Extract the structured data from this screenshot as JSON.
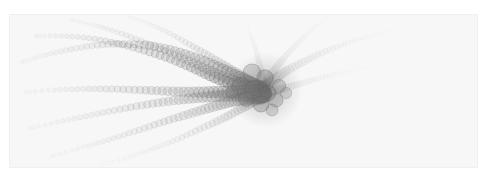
{
  "figure": {
    "title": "",
    "subtitle": "",
    "width": 491,
    "height": 180,
    "page_background": "#ffffff",
    "panel_background": "#f7f7f7",
    "panel_edge_color": "#f0f0f0",
    "panel": {
      "x": 9,
      "y": 14,
      "width": 469,
      "height": 154
    },
    "has_axes": false,
    "has_gridlines": false,
    "has_legend": false,
    "has_text_labels": false,
    "alt_text": "A pale grey radial structure resembling a comet or tentacled organism, formed from chains of overlapping circles converging into a dark cluster right of center, with arms sweeping out to the left and faint ghost arms to the upper right."
  },
  "chart_data": {
    "type": "scatter",
    "title": "",
    "subtitle": "",
    "xlabel": "",
    "ylabel": "",
    "xlim": [
      0,
      491
    ],
    "ylim": [
      0,
      180
    ],
    "grid": false,
    "legend_position": "none",
    "marker": "circle",
    "marker_style": {
      "fill_color": "#808080",
      "stroke_color": "#606060",
      "stroke_width": 0.6,
      "fill_opacity_range": [
        0.02,
        0.5
      ],
      "radius_range": [
        1.4,
        9.5
      ]
    },
    "core": {
      "label": "convergence cluster",
      "x": 265,
      "y": 90,
      "darkest_color": "#505050",
      "approx_radius": 38
    },
    "annotations": [],
    "series": [
      {
        "name": "arm-1-upper-left-far",
        "opacity": 0.3,
        "tip_radius": 2.2,
        "base_radius": 7.0,
        "n_points": 52,
        "path": [
          [
            22,
            62
          ],
          [
            46,
            55
          ],
          [
            72,
            49
          ],
          [
            99,
            45
          ],
          [
            126,
            44
          ],
          [
            152,
            46
          ],
          [
            178,
            52
          ],
          [
            203,
            61
          ],
          [
            226,
            71
          ],
          [
            246,
            81
          ],
          [
            261,
            88
          ]
        ]
      },
      {
        "name": "arm-2-upper-left-mid",
        "opacity": 0.4,
        "tip_radius": 2.0,
        "base_radius": 7.6,
        "n_points": 50,
        "path": [
          [
            36,
            36
          ],
          [
            61,
            36
          ],
          [
            88,
            38
          ],
          [
            115,
            43
          ],
          [
            142,
            50
          ],
          [
            168,
            58
          ],
          [
            193,
            68
          ],
          [
            216,
            78
          ],
          [
            238,
            86
          ],
          [
            255,
            91
          ],
          [
            264,
            93
          ]
        ]
      },
      {
        "name": "arm-3-upper-steep",
        "opacity": 0.26,
        "tip_radius": 1.8,
        "base_radius": 6.8,
        "n_points": 46,
        "path": [
          [
            72,
            20
          ],
          [
            94,
            25
          ],
          [
            117,
            32
          ],
          [
            141,
            41
          ],
          [
            165,
            51
          ],
          [
            189,
            61
          ],
          [
            211,
            71
          ],
          [
            231,
            80
          ],
          [
            248,
            86
          ],
          [
            260,
            90
          ]
        ]
      },
      {
        "name": "arm-4-top-center",
        "opacity": 0.2,
        "tip_radius": 1.6,
        "base_radius": 6.2,
        "n_points": 42,
        "path": [
          [
            128,
            16
          ],
          [
            147,
            23
          ],
          [
            167,
            32
          ],
          [
            187,
            43
          ],
          [
            206,
            54
          ],
          [
            224,
            65
          ],
          [
            240,
            75
          ],
          [
            253,
            83
          ],
          [
            262,
            89
          ]
        ]
      },
      {
        "name": "arm-5-left-horizontal",
        "opacity": 0.34,
        "tip_radius": 2.0,
        "base_radius": 8.0,
        "n_points": 50,
        "path": [
          [
            26,
            92
          ],
          [
            54,
            90
          ],
          [
            82,
            89
          ],
          [
            110,
            89
          ],
          [
            138,
            90
          ],
          [
            165,
            91
          ],
          [
            191,
            92
          ],
          [
            215,
            92
          ],
          [
            237,
            92
          ],
          [
            254,
            92
          ],
          [
            263,
            92
          ]
        ]
      },
      {
        "name": "arm-6-lower-left-shallow",
        "opacity": 0.3,
        "tip_radius": 2.0,
        "base_radius": 7.8,
        "n_points": 52,
        "path": [
          [
            30,
            128
          ],
          [
            58,
            122
          ],
          [
            87,
            116
          ],
          [
            116,
            110
          ],
          [
            144,
            105
          ],
          [
            171,
            101
          ],
          [
            196,
            98
          ],
          [
            219,
            96
          ],
          [
            239,
            95
          ],
          [
            254,
            95
          ],
          [
            264,
            95
          ]
        ]
      },
      {
        "name": "arm-7-lower-left-steep",
        "opacity": 0.24,
        "tip_radius": 1.8,
        "base_radius": 7.2,
        "n_points": 50,
        "path": [
          [
            52,
            156
          ],
          [
            80,
            148
          ],
          [
            108,
            140
          ],
          [
            136,
            131
          ],
          [
            163,
            122
          ],
          [
            189,
            114
          ],
          [
            212,
            107
          ],
          [
            232,
            101
          ],
          [
            249,
            98
          ],
          [
            262,
            97
          ]
        ]
      },
      {
        "name": "arm-8-lower-bottom",
        "opacity": 0.16,
        "tip_radius": 1.6,
        "base_radius": 6.0,
        "n_points": 44,
        "path": [
          [
            100,
            166
          ],
          [
            126,
            158
          ],
          [
            152,
            149
          ],
          [
            178,
            139
          ],
          [
            202,
            128
          ],
          [
            224,
            118
          ],
          [
            242,
            108
          ],
          [
            256,
            100
          ],
          [
            264,
            96
          ]
        ]
      },
      {
        "name": "ghost-arm-9-upper-right",
        "opacity": 0.09,
        "tip_radius": 1.6,
        "base_radius": 6.0,
        "n_points": 44,
        "path": [
          [
            392,
            30
          ],
          [
            370,
            36
          ],
          [
            347,
            43
          ],
          [
            324,
            52
          ],
          [
            303,
            62
          ],
          [
            285,
            72
          ],
          [
            272,
            81
          ],
          [
            265,
            87
          ]
        ]
      },
      {
        "name": "ghost-arm-10-right-high",
        "opacity": 0.07,
        "tip_radius": 1.5,
        "base_radius": 5.4,
        "n_points": 40,
        "path": [
          [
            330,
            16
          ],
          [
            318,
            25
          ],
          [
            305,
            36
          ],
          [
            293,
            48
          ],
          [
            282,
            60
          ],
          [
            273,
            72
          ],
          [
            267,
            82
          ],
          [
            264,
            88
          ]
        ]
      },
      {
        "name": "ghost-arm-11-right-low",
        "opacity": 0.07,
        "tip_radius": 1.5,
        "base_radius": 5.4,
        "n_points": 40,
        "path": [
          [
            372,
            66
          ],
          [
            352,
            70
          ],
          [
            332,
            75
          ],
          [
            313,
            80
          ],
          [
            296,
            85
          ],
          [
            282,
            89
          ],
          [
            271,
            92
          ],
          [
            265,
            94
          ]
        ]
      },
      {
        "name": "ghost-arm-12-top-far",
        "opacity": 0.06,
        "tip_radius": 1.4,
        "base_radius": 5.0,
        "n_points": 38,
        "path": [
          [
            246,
            18
          ],
          [
            249,
            30
          ],
          [
            253,
            42
          ],
          [
            257,
            54
          ],
          [
            260,
            66
          ],
          [
            262,
            77
          ],
          [
            263,
            85
          ],
          [
            264,
            90
          ]
        ]
      }
    ],
    "core_blobs": [
      {
        "x": 252,
        "y": 73,
        "r": 9.0,
        "opacity": 0.3
      },
      {
        "x": 265,
        "y": 78,
        "r": 8.2,
        "opacity": 0.34
      },
      {
        "x": 241,
        "y": 86,
        "r": 8.6,
        "opacity": 0.32
      },
      {
        "x": 254,
        "y": 90,
        "r": 9.4,
        "opacity": 0.36
      },
      {
        "x": 268,
        "y": 93,
        "r": 7.8,
        "opacity": 0.34
      },
      {
        "x": 246,
        "y": 99,
        "r": 7.4,
        "opacity": 0.3
      },
      {
        "x": 261,
        "y": 104,
        "r": 8.0,
        "opacity": 0.32
      },
      {
        "x": 276,
        "y": 100,
        "r": 7.0,
        "opacity": 0.3
      },
      {
        "x": 279,
        "y": 86,
        "r": 6.6,
        "opacity": 0.28
      },
      {
        "x": 232,
        "y": 92,
        "r": 6.2,
        "opacity": 0.26
      },
      {
        "x": 272,
        "y": 110,
        "r": 6.0,
        "opacity": 0.26
      },
      {
        "x": 286,
        "y": 93,
        "r": 5.6,
        "opacity": 0.24
      }
    ]
  }
}
